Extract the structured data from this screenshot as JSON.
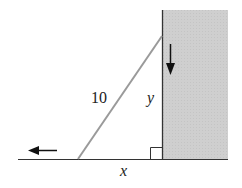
{
  "diagram": {
    "labels": {
      "ladder_length": "10",
      "wall_height": "y",
      "ground_distance": "x"
    },
    "colors": {
      "wall_fill": "#cfcfcf",
      "ladder": "#9a9a9a",
      "lines": "#333333",
      "arrows": "#111111"
    },
    "elements": {
      "wall": {
        "x": 162,
        "y": 10,
        "width": 66,
        "height": 149
      },
      "ground_line": {
        "x1": 18,
        "x2": 228,
        "y": 159
      },
      "ladder": {
        "x1": 78,
        "y1": 159,
        "x2": 162,
        "y2": 36
      },
      "right_angle_marker": {
        "x": 150,
        "y": 147,
        "size": 12
      },
      "arrow_down": {
        "x": 170,
        "y1": 44,
        "y2": 75
      },
      "arrow_left": {
        "x1": 57,
        "x2": 28,
        "y": 150
      }
    }
  }
}
